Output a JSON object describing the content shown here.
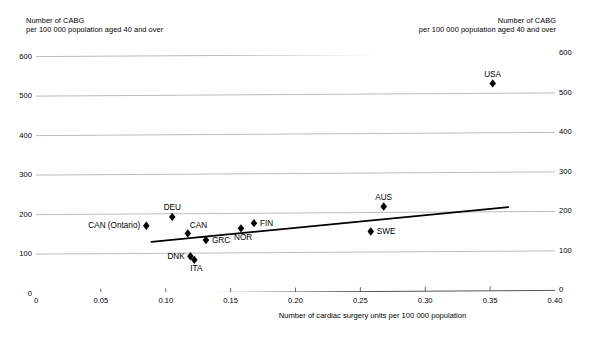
{
  "title_partial": "cardiac surgery units",
  "yaxis": {
    "caption_left_line1": "Number of CABG",
    "caption_left_line2": "per 100 000 population aged 40 and over",
    "caption_right_line1": "Number of CABG",
    "caption_right_line2": "per 100 000 population aged 40 and over",
    "ticks": [
      "0",
      "100",
      "200",
      "300",
      "400",
      "500",
      "600"
    ]
  },
  "xaxis": {
    "title": "Number of cardiac surgery units per 100 000 population",
    "ticks": [
      "0",
      "0.05",
      "0.10",
      "0.15",
      "0.20",
      "0.25",
      "0.30",
      "0.35",
      "0.40"
    ]
  },
  "chart_data": {
    "type": "scatter",
    "title": "cardiac surgery units",
    "xlabel": "Number of cardiac surgery units per 100 000 population",
    "ylabel": "Number of CABG per 100 000 population aged 40 and over",
    "xlim": [
      0,
      0.4
    ],
    "ylim": [
      0,
      600
    ],
    "xticks": [
      0,
      0.05,
      0.1,
      0.15,
      0.2,
      0.25,
      0.3,
      0.35,
      0.4
    ],
    "yticks": [
      0,
      100,
      200,
      300,
      400,
      500,
      600
    ],
    "grid": "horizontal",
    "legend": "none",
    "marker": "diamond",
    "points": [
      {
        "label": "CAN (Ontario)",
        "x": 0.085,
        "y": 170,
        "label_pos": "left"
      },
      {
        "label": "DEU",
        "x": 0.105,
        "y": 192,
        "label_pos": "above"
      },
      {
        "label": "CAN",
        "x": 0.117,
        "y": 150,
        "label_pos": "above-right"
      },
      {
        "label": "DNK",
        "x": 0.119,
        "y": 92,
        "label_pos": "left"
      },
      {
        "label": "ITA",
        "x": 0.122,
        "y": 83,
        "label_pos": "below"
      },
      {
        "label": "GRC",
        "x": 0.131,
        "y": 133,
        "label_pos": "right"
      },
      {
        "label": "NOR",
        "x": 0.158,
        "y": 162,
        "label_pos": "below"
      },
      {
        "label": "FIN",
        "x": 0.168,
        "y": 175,
        "label_pos": "right"
      },
      {
        "label": "SWE",
        "x": 0.258,
        "y": 152,
        "label_pos": "right"
      },
      {
        "label": "AUS",
        "x": 0.268,
        "y": 215,
        "label_pos": "above"
      },
      {
        "label": "USA",
        "x": 0.352,
        "y": 525,
        "label_pos": "above"
      }
    ],
    "trendline": {
      "x0": 0.089,
      "y0": 127,
      "x1": 0.364,
      "y1": 215
    }
  }
}
